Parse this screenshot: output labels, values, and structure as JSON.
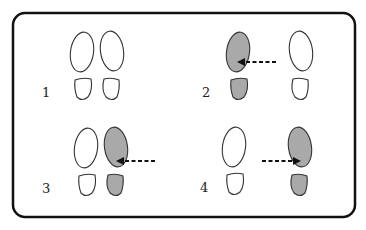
{
  "diagram": {
    "colors": {
      "border": "#111111",
      "outline": "#333333",
      "shaded_fill": "#a9a9a9",
      "empty_fill": "#ffffff",
      "arrow": "#111111"
    },
    "panels": [
      {
        "label": "1",
        "left_foot": {
          "shaded": false
        },
        "right_foot": {
          "shaded": false
        },
        "arrow": null
      },
      {
        "label": "2",
        "left_foot": {
          "shaded": true
        },
        "right_foot": {
          "shaded": false
        },
        "arrow": {
          "direction": "left",
          "style": "dashed"
        }
      },
      {
        "label": "3",
        "left_foot": {
          "shaded": false
        },
        "right_foot": {
          "shaded": true
        },
        "arrow": {
          "direction": "left",
          "style": "dashed"
        }
      },
      {
        "label": "4",
        "left_foot": {
          "shaded": false
        },
        "right_foot": {
          "shaded": true
        },
        "arrow": {
          "direction": "right",
          "style": "dashed"
        }
      }
    ]
  }
}
